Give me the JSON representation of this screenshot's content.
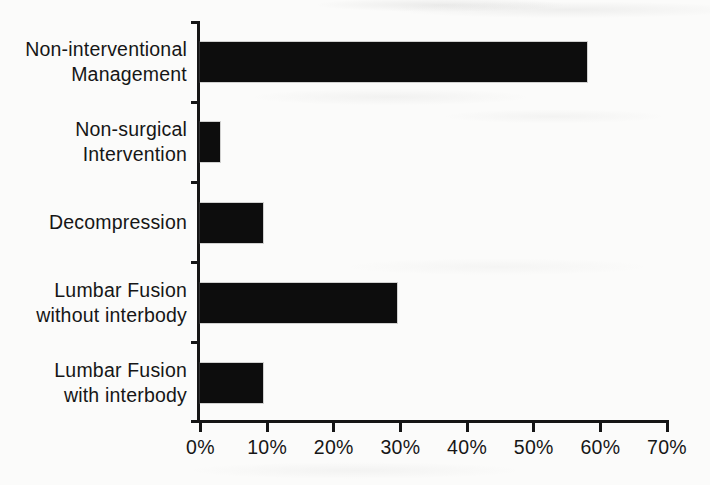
{
  "page": {
    "background_color": "#fbfbfa",
    "title": ""
  },
  "chart_data": {
    "type": "bar",
    "orientation": "horizontal",
    "title": "",
    "xlabel": "",
    "ylabel": "",
    "categories": [
      "Non-interventional Management",
      "Non-surgical Intervention",
      "Decompression",
      "Lumbar Fusion without interbody",
      "Lumbar Fusion with interbody"
    ],
    "category_label_lines": [
      [
        "Non-interventional",
        "Management"
      ],
      [
        "Non-surgical",
        "Intervention"
      ],
      [
        "Decompression"
      ],
      [
        "Lumbar Fusion",
        "without interbody"
      ],
      [
        "Lumbar Fusion",
        "with interbody"
      ]
    ],
    "values": [
      58,
      3,
      9.5,
      29.5,
      9.5
    ],
    "unit": "%",
    "xlim": [
      0,
      70
    ],
    "x_tick_values": [
      0,
      10,
      20,
      30,
      40,
      50,
      60,
      70
    ],
    "x_tick_labels": [
      "0%",
      "10%",
      "20%",
      "30%",
      "40%",
      "50%",
      "60%",
      "70%"
    ],
    "grid": false,
    "legend": null,
    "bar_color": "#0d0d0d",
    "axis_color": "#151515",
    "text_color": "#161616"
  }
}
